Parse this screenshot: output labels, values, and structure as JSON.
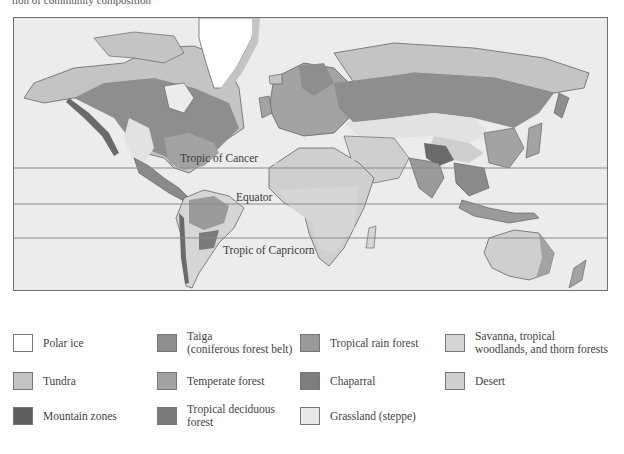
{
  "caption": "tion of community composition",
  "map": {
    "lines": [
      {
        "id": "tropic-of-cancer",
        "label": "Tropic of Cancer",
        "y": 150,
        "label_x": 166,
        "label_y": 134
      },
      {
        "id": "equator",
        "label": "Equator",
        "y": 186,
        "label_x": 209,
        "label_y": 173
      },
      {
        "id": "tropic-of-capricorn",
        "label": "Tropic of Capricorn",
        "y": 220,
        "label_x": 209,
        "label_y": 226
      }
    ],
    "colors": {
      "ocean": "#ececec",
      "polar_ice": "#ffffff",
      "tundra": "#c4c4c4",
      "taiga": "#8e8e8e",
      "temperate_forest": "#a3a3a3",
      "tropical_rain_forest": "#9a9a9a",
      "chaparral": "#7d7d7d",
      "savanna": "#d6d6d6",
      "desert": "#cfcfcf",
      "grassland": "#e2e2e2",
      "mountain": "#6a6a6a",
      "tropical_deciduous": "#7a7a7a",
      "line": "#8a8a8a"
    }
  },
  "legend": {
    "items": [
      {
        "name": "polar-ice",
        "label": "Polar ice",
        "color": "#ffffff",
        "x": 13,
        "y": 334
      },
      {
        "name": "taiga",
        "label": "Taiga\n(coniferous forest belt)",
        "color": "#8e8e8e",
        "x": 157,
        "y": 334
      },
      {
        "name": "tropical-rain-forest",
        "label": "Tropical rain forest",
        "color": "#9a9a9a",
        "x": 300,
        "y": 334
      },
      {
        "name": "savanna",
        "label": "Savanna, tropical\nwoodlands, and thorn forests",
        "color": "#d6d6d6",
        "x": 445,
        "y": 334
      },
      {
        "name": "tundra",
        "label": "Tundra",
        "color": "#c4c4c4",
        "x": 13,
        "y": 372
      },
      {
        "name": "temperate-forest",
        "label": "Temperate forest",
        "color": "#a3a3a3",
        "x": 157,
        "y": 372
      },
      {
        "name": "chaparral",
        "label": "Chaparral",
        "color": "#7d7d7d",
        "x": 300,
        "y": 372
      },
      {
        "name": "desert",
        "label": "Desert",
        "color": "#cfcfcf",
        "x": 445,
        "y": 372
      },
      {
        "name": "mountain-zones",
        "label": "Mountain zones",
        "color": "#5f5f5f",
        "x": 13,
        "y": 407
      },
      {
        "name": "tropical-deciduous-forest",
        "label": "Tropical deciduous\nforest",
        "color": "#7a7a7a",
        "x": 157,
        "y": 407
      },
      {
        "name": "grassland",
        "label": "Grassland (steppe)",
        "color": "#e8e8e8",
        "x": 300,
        "y": 407
      }
    ]
  }
}
